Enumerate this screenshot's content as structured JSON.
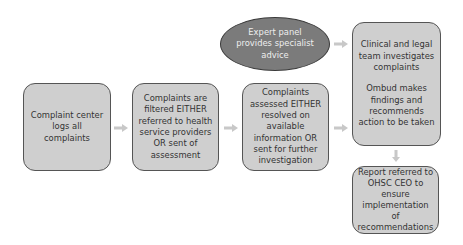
{
  "diagram": {
    "type": "flowchart",
    "colors": {
      "box_fill": "#cfcfcf",
      "box_border": "#555555",
      "ellipse_fill": "#7b7b7b",
      "ellipse_text": "#eeeeee",
      "arrow": "#c8c8c8"
    },
    "nodes": {
      "complaint_center": "Complaint center logs all complaints",
      "filtered": "Complaints are filtered EITHER referred to health service providers OR sent of assessment",
      "assessed": "Complaints assessed EITHER resolved on available information OR sent for further investigation",
      "expert_panel": "Expert panel provides specialist advice",
      "investigation_part1": "Clinical and legal team investigates complaints",
      "investigation_part2": "Ombud makes findings and recommends action to be taken",
      "report": "Report referred to OHSC CEO to ensure implementation of recommendations"
    },
    "edges": [
      {
        "from": "complaint_center",
        "to": "filtered"
      },
      {
        "from": "filtered",
        "to": "assessed"
      },
      {
        "from": "assessed",
        "to": "investigation"
      },
      {
        "from": "expert_panel",
        "to": "investigation"
      },
      {
        "from": "investigation",
        "to": "report"
      }
    ]
  }
}
